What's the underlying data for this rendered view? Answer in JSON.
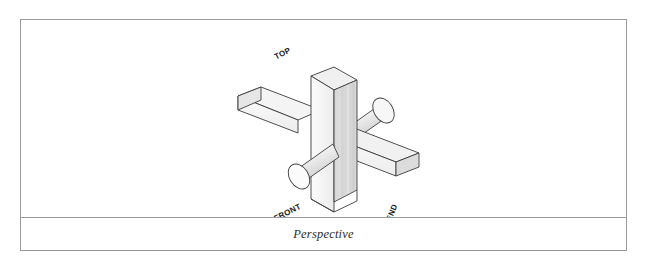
{
  "figure": {
    "caption": "Perspective",
    "frame_color": "#9a9a9a",
    "background": "#ffffff",
    "labels": {
      "top": "TOP",
      "front": "FRONT",
      "end": "END"
    },
    "illustration": {
      "name": "isometric-cross-block-assembly",
      "description": "Isometric line drawing of a vertical rectangular column intersected by two horizontal rectangular bars and one cylindrical rod",
      "parts": [
        {
          "name": "vertical-column",
          "shape": "rectangular-prism",
          "orientation": "vertical"
        },
        {
          "name": "left-horizontal-bar",
          "shape": "rectangular-prism",
          "orientation": "receding-left"
        },
        {
          "name": "right-horizontal-bar",
          "shape": "rectangular-prism",
          "orientation": "receding-right"
        },
        {
          "name": "cylinder-rod",
          "shape": "cylinder",
          "orientation": "receding-diagonal"
        }
      ],
      "stroke_color": "#3c3c3c",
      "face_fills": {
        "top_light": "#f2f2f2",
        "side_light": "#fbfbfb",
        "side_mid": "#e3e3e3",
        "side_dark": "#cfcfcf"
      }
    }
  }
}
